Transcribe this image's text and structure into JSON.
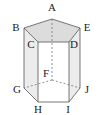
{
  "diagram": {
    "colors": {
      "edge": "#555555",
      "hidden_edge": "#777777",
      "top_face": "#dcdcdc",
      "side_face": "#ececec",
      "front_face": "#ffffff"
    },
    "vertices": {
      "A": {
        "label": "A",
        "x": 52,
        "y": 19
      },
      "B": {
        "label": "B",
        "x": 24,
        "y": 28
      },
      "C": {
        "label": "C",
        "x": 38,
        "y": 42
      },
      "D": {
        "label": "D",
        "x": 69,
        "y": 42
      },
      "E": {
        "label": "E",
        "x": 80,
        "y": 28
      },
      "F": {
        "label": "F",
        "x": 52,
        "y": 80
      },
      "G": {
        "label": "G",
        "x": 24,
        "y": 88
      },
      "H": {
        "label": "H",
        "x": 38,
        "y": 102
      },
      "I": {
        "label": "I",
        "x": 69,
        "y": 102
      },
      "J": {
        "label": "J",
        "x": 80,
        "y": 88
      }
    },
    "labels": [
      {
        "id": "A",
        "text": "A",
        "x": 52,
        "y": 11
      },
      {
        "id": "B",
        "text": "B",
        "x": 16,
        "y": 31
      },
      {
        "id": "C",
        "text": "C",
        "x": 31,
        "y": 48
      },
      {
        "id": "D",
        "text": "D",
        "x": 74,
        "y": 48
      },
      {
        "id": "E",
        "text": "E",
        "x": 87,
        "y": 31
      },
      {
        "id": "F",
        "text": "F",
        "x": 46,
        "y": 77
      },
      {
        "id": "G",
        "text": "G",
        "x": 17,
        "y": 93
      },
      {
        "id": "H",
        "text": "H",
        "x": 38,
        "y": 113
      },
      {
        "id": "I",
        "text": "I",
        "x": 68,
        "y": 113
      },
      {
        "id": "J",
        "text": "J",
        "x": 87,
        "y": 93
      }
    ],
    "hidden_edges": [
      "AF",
      "FG",
      "FJ"
    ]
  }
}
